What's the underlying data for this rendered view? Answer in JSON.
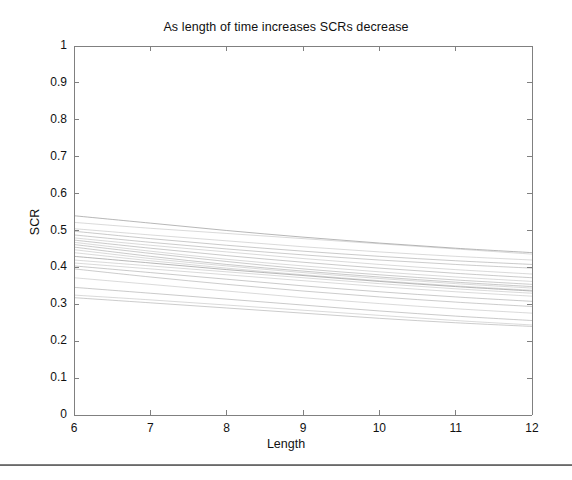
{
  "figure": {
    "title": "As length of time increases SCRs decrease",
    "background_color": "#ffffff",
    "axis_color": "#808080",
    "line_color": "#9a9a9a",
    "text_color": "#111111"
  },
  "axes": {
    "x_label": "Length",
    "y_label": "SCR",
    "x_ticks": [
      "6",
      "7",
      "8",
      "9",
      "10",
      "11",
      "12"
    ],
    "y_ticks": [
      "0",
      "0.1",
      "0.2",
      "0.3",
      "0.4",
      "0.5",
      "0.6",
      "0.7",
      "0.8",
      "0.9",
      "1"
    ]
  },
  "footer": {
    "rule_visible": "true"
  },
  "chart_data": {
    "type": "line",
    "title": "As length of time increases SCRs decrease",
    "xlabel": "Length",
    "ylabel": "SCR",
    "xlim": [
      6,
      12
    ],
    "ylim": [
      0,
      1
    ],
    "xticks": [
      6,
      7,
      8,
      9,
      10,
      11,
      12
    ],
    "yticks": [
      0,
      0.1,
      0.2,
      0.3,
      0.4,
      0.5,
      0.6,
      0.7,
      0.8,
      0.9,
      1
    ],
    "grid": false,
    "legend": "none",
    "tick_direction": "in",
    "box": true,
    "x": [
      6,
      7,
      8,
      9,
      10,
      11,
      12
    ],
    "series": [
      {
        "name": "line-01",
        "values": [
          0.54,
          0.52,
          0.5,
          0.482,
          0.466,
          0.452,
          0.44
        ]
      },
      {
        "name": "line-02",
        "values": [
          0.522,
          0.506,
          0.492,
          0.478,
          0.464,
          0.45,
          0.436
        ]
      },
      {
        "name": "line-03",
        "values": [
          0.505,
          0.488,
          0.472,
          0.456,
          0.442,
          0.43,
          0.42
        ]
      },
      {
        "name": "line-04",
        "values": [
          0.498,
          0.478,
          0.46,
          0.444,
          0.43,
          0.418,
          0.408
        ]
      },
      {
        "name": "line-05",
        "values": [
          0.488,
          0.468,
          0.45,
          0.434,
          0.42,
          0.408,
          0.398
        ]
      },
      {
        "name": "line-06",
        "values": [
          0.48,
          0.46,
          0.442,
          0.424,
          0.408,
          0.394,
          0.382
        ]
      },
      {
        "name": "line-07",
        "values": [
          0.474,
          0.452,
          0.432,
          0.414,
          0.398,
          0.384,
          0.372
        ]
      },
      {
        "name": "line-08",
        "values": [
          0.468,
          0.444,
          0.422,
          0.404,
          0.388,
          0.374,
          0.362
        ]
      },
      {
        "name": "line-09",
        "values": [
          0.462,
          0.438,
          0.416,
          0.396,
          0.38,
          0.366,
          0.354
        ]
      },
      {
        "name": "line-10",
        "values": [
          0.455,
          0.43,
          0.408,
          0.39,
          0.374,
          0.36,
          0.348
        ]
      },
      {
        "name": "line-11",
        "values": [
          0.448,
          0.424,
          0.404,
          0.386,
          0.37,
          0.356,
          0.344
        ]
      },
      {
        "name": "line-12",
        "values": [
          0.44,
          0.418,
          0.398,
          0.38,
          0.364,
          0.35,
          0.338
        ]
      },
      {
        "name": "line-13",
        "values": [
          0.43,
          0.412,
          0.394,
          0.378,
          0.362,
          0.348,
          0.336
        ]
      },
      {
        "name": "line-14",
        "values": [
          0.42,
          0.404,
          0.388,
          0.372,
          0.356,
          0.342,
          0.33
        ]
      },
      {
        "name": "line-15",
        "values": [
          0.412,
          0.396,
          0.38,
          0.364,
          0.348,
          0.334,
          0.322
        ]
      },
      {
        "name": "line-16",
        "values": [
          0.404,
          0.386,
          0.368,
          0.35,
          0.334,
          0.32,
          0.308
        ]
      },
      {
        "name": "line-17",
        "values": [
          0.396,
          0.374,
          0.354,
          0.336,
          0.32,
          0.306,
          0.294
        ]
      },
      {
        "name": "line-18",
        "values": [
          0.372,
          0.354,
          0.336,
          0.318,
          0.302,
          0.288,
          0.276
        ]
      },
      {
        "name": "line-19",
        "values": [
          0.346,
          0.33,
          0.314,
          0.298,
          0.282,
          0.268,
          0.256
        ]
      },
      {
        "name": "line-20",
        "values": [
          0.325,
          0.312,
          0.298,
          0.284,
          0.27,
          0.256,
          0.244
        ]
      },
      {
        "name": "line-21",
        "values": [
          0.318,
          0.304,
          0.29,
          0.276,
          0.262,
          0.25,
          0.24
        ]
      }
    ]
  }
}
